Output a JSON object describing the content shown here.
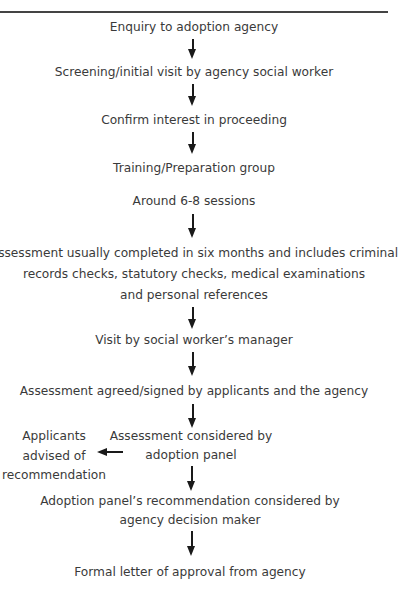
{
  "diagram": {
    "type": "flowchart",
    "direction": "top-to-bottom",
    "colors": {
      "text": "#3a3a3a",
      "arrow": "#1a1a1a",
      "rule": "#444444",
      "background": "#ffffff"
    },
    "steps": [
      {
        "id": "enquiry",
        "lines": [
          "Enquiry to adoption agency"
        ]
      },
      {
        "id": "screening",
        "lines": [
          "Screening/initial visit by agency social worker"
        ]
      },
      {
        "id": "confirm",
        "lines": [
          "Confirm interest in proceeding"
        ]
      },
      {
        "id": "training",
        "lines": [
          "Training/Preparation group"
        ]
      },
      {
        "id": "sessions",
        "lines": [
          "Around 6-8 sessions"
        ]
      },
      {
        "id": "assessment",
        "lines": [
          "Assessment usually completed in six months and includes criminal",
          "records checks, statutory checks, medical examinations",
          "and personal references"
        ]
      },
      {
        "id": "manager-visit",
        "lines": [
          "Visit by social worker’s manager"
        ]
      },
      {
        "id": "agreed-signed",
        "lines": [
          "Assessment agreed/signed by applicants and the agency"
        ]
      },
      {
        "id": "panel",
        "lines": [
          "Assessment considered by",
          "adoption panel"
        ]
      },
      {
        "id": "decision-maker",
        "lines": [
          "Adoption panel’s recommendation considered by",
          "agency decision maker"
        ]
      },
      {
        "id": "approval",
        "lines": [
          "Formal letter of approval from agency"
        ]
      }
    ],
    "side_branch": {
      "id": "applicants-advised",
      "from": "panel",
      "direction": "left",
      "lines": [
        "Applicants",
        "advised of",
        "recommendation"
      ]
    },
    "edges": [
      [
        "enquiry",
        "screening"
      ],
      [
        "screening",
        "confirm"
      ],
      [
        "confirm",
        "training"
      ],
      [
        "sessions",
        "assessment"
      ],
      [
        "assessment",
        "manager-visit"
      ],
      [
        "manager-visit",
        "agreed-signed"
      ],
      [
        "agreed-signed",
        "panel"
      ],
      [
        "panel",
        "applicants-advised"
      ],
      [
        "panel",
        "decision-maker"
      ],
      [
        "decision-maker",
        "approval"
      ]
    ]
  }
}
